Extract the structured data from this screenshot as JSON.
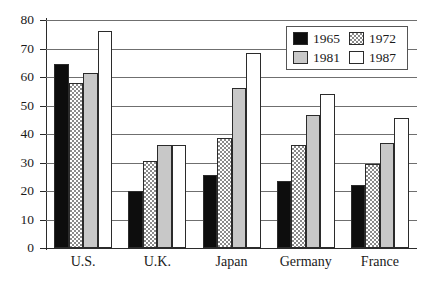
{
  "chart_data": {
    "type": "bar",
    "title": "",
    "subtitle": "",
    "xlabel": "",
    "ylabel": "",
    "categories": [
      "U.S.",
      "U.K.",
      "Japan",
      "Germany",
      "France"
    ],
    "series": [
      {
        "name": "1965",
        "values": [
          64.5,
          20.0,
          25.5,
          23.5,
          22.0
        ],
        "color": "#0d0d0d",
        "fill": "solid-black"
      },
      {
        "name": "1972",
        "values": [
          58.0,
          30.5,
          38.5,
          36.0,
          29.5
        ],
        "color": "#8a8a8a",
        "fill": "checkered-hatch"
      },
      {
        "name": "1981",
        "values": [
          61.5,
          36.0,
          56.0,
          46.5,
          37.0
        ],
        "color": "#c8c8c8",
        "fill": "solid-gray"
      },
      {
        "name": "1987",
        "values": [
          76.0,
          36.0,
          68.5,
          54.0,
          45.5
        ],
        "color": "#ffffff",
        "fill": "solid-white"
      }
    ],
    "ylim": [
      0,
      80
    ],
    "ytick_step": 10,
    "yticks": [
      0,
      10,
      20,
      30,
      40,
      50,
      60,
      70,
      80
    ],
    "ytick_labels": [
      "0",
      "10",
      "20",
      "30",
      "40",
      "50",
      "60",
      "70",
      "80"
    ],
    "grid": "horizontal",
    "legend_position": "upper-right-inside",
    "legend_layout": "2x2",
    "axis_color": "#2b2b2b",
    "grid_color": "#6f6f6f",
    "background": "#ffffff"
  }
}
